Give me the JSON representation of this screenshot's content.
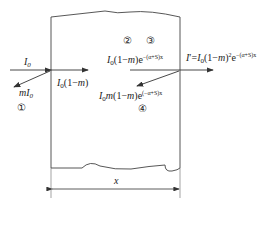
{
  "diagram": {
    "labels": {
      "incident": "I0",
      "reflected": "mI0",
      "entering": "I0(1-m)",
      "before_exit": "I0(1-m)e^-(α+S)x",
      "internal_reflected": "I0m(1-m)e^-(α+S)x",
      "transmitted": "I'=I0(1-m)^2 e^-(α+S)x",
      "thickness": "x"
    },
    "markers": [
      "①",
      "②",
      "③",
      "④"
    ],
    "colors": {
      "line": "#333333",
      "background": "#ffffff"
    }
  }
}
